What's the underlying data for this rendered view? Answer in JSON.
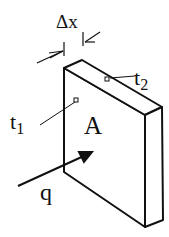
{
  "diagram": {
    "type": "heat-conduction-slab",
    "labels": {
      "thickness": "Δx",
      "t1": "t",
      "t1_sub": "1",
      "t2": "t",
      "t2_sub": "2",
      "area": "A",
      "heat_flux": "q"
    },
    "colors": {
      "stroke": "#111111",
      "background": "#ffffff"
    }
  }
}
